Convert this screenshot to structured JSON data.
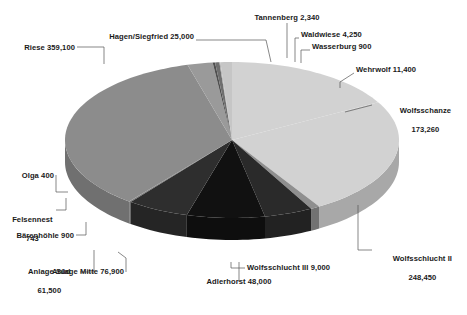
{
  "chart_data": {
    "type": "pie",
    "title": "",
    "subtitle": "",
    "xlabel": "",
    "ylabel": "",
    "legend_position": "none",
    "grid": false,
    "style": "3d-pie",
    "start_angle_deg": 0,
    "direction": "clockwise",
    "total": 1021243,
    "categories": [
      "Wolfsschanze",
      "Wolfsschlucht II",
      "Wolfsschlucht III",
      "Adlerhorst",
      "Anlage Mitte",
      "Anlage Süd",
      "Bärenhöhle",
      "Felsennest",
      "Olga",
      "Riese",
      "Hagen/Siegfried",
      "Tannenberg",
      "Waldwiese",
      "Wasserburg",
      "Wehrwolf"
    ],
    "values": [
      173260,
      248450,
      9000,
      48000,
      76900,
      61500,
      900,
      743,
      400,
      359100,
      25000,
      2340,
      4250,
      900,
      11400
    ],
    "value_labels": [
      "173,260",
      "248,450",
      "9,000",
      "48,000",
      "76,900",
      "61,500",
      "900",
      "743",
      "400",
      "359,100",
      "25,000",
      "2,340",
      "4,250",
      "900",
      "11,400"
    ],
    "slice_colors": [
      "#d2d2d2",
      "#d2d2d2",
      "#8f8f8f",
      "#2a2a2a",
      "#111111",
      "#2e2e2e",
      "#5a5a5a",
      "#4a4a4a",
      "#b4b4b4",
      "#8c8c8c",
      "#9a9a9a",
      "#4f4f4f",
      "#6f6f6f",
      "#a8a8a8",
      "#c6c6c6"
    ],
    "annotations": [
      {
        "name": "riese",
        "text": "Riese 359,100"
      },
      {
        "name": "hagen-siegfried",
        "text": "Hagen/Siegfried 25,000"
      },
      {
        "name": "tannenberg",
        "text": "Tannenberg 2,340"
      },
      {
        "name": "waldwiese",
        "text": "Waldwiese 4,250"
      },
      {
        "name": "wasserburg",
        "text": "Wasserburg 900"
      },
      {
        "name": "wehrwolf",
        "text": "Wehrwolf 11,400"
      },
      {
        "name": "wolfsschanze",
        "text": "Wolfsschanze\n173,260"
      },
      {
        "name": "wolfsschlucht-2",
        "text": "Wolfsschlucht II\n248,450"
      },
      {
        "name": "wolfsschlucht-3",
        "text": "Wolfsschlucht III 9,000"
      },
      {
        "name": "adlerhorst",
        "text": "Adlerhorst 48,000"
      },
      {
        "name": "anlage-mitte",
        "text": "Anlage Mitte 76,900"
      },
      {
        "name": "anlage-sued",
        "text": "Anlage Süd\n61,500"
      },
      {
        "name": "baerenhoehle",
        "text": "Bärenhöhle 900"
      },
      {
        "name": "felsennest",
        "text": "Felsennest\n743"
      },
      {
        "name": "olga",
        "text": "Olga 400"
      }
    ]
  },
  "labels": {
    "riese": "Riese 359,100",
    "hagen": "Hagen/Siegfried 25,000",
    "tannenberg": "Tannenberg 2,340",
    "waldwiese": "Waldwiese 4,250",
    "wasserburg": "Wasserburg 900",
    "wehrwolf": "Wehrwolf 11,400",
    "wolfsschanze_name": "Wolfsschanze",
    "wolfsschanze_value": "173,260",
    "wolfsschlucht2_name": "Wolfsschlucht II",
    "wolfsschlucht2_value": "248,450",
    "wolfsschlucht3": "Wolfsschlucht III 9,000",
    "adlerhorst": "Adlerhorst 48,000",
    "anlage_mitte": "Anlage Mitte 76,900",
    "anlage_sued_name": "Anlage Süd",
    "anlage_sued_value": "61,500",
    "baerenhoehle": "Bärenhöhle 900",
    "felsennest_name": "Felsennest",
    "felsennest_value": "743",
    "olga": "Olga 400"
  },
  "colors": {
    "background": "#ffffff",
    "text": "#1a1a1a",
    "leader_line": "#555555"
  }
}
